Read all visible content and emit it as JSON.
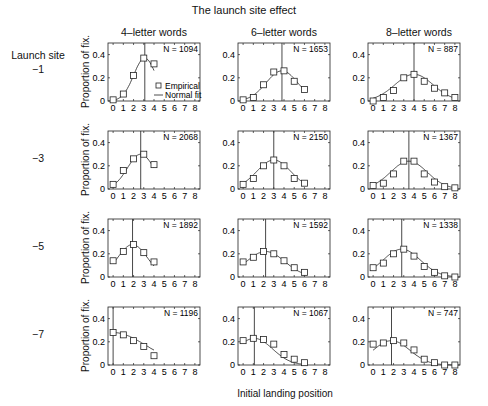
{
  "figure": {
    "title": "The launch site effect",
    "row_header": "Launch site",
    "column_titles": [
      "4–letter words",
      "6–letter words",
      "8–letter words"
    ],
    "row_labels": [
      "−1",
      "−3",
      "−5",
      "−7"
    ],
    "ylabel": "Proportion of fix.",
    "xlabel": "Initial landing position",
    "legend": {
      "empirical": "Empirical",
      "fit": "Normal fit"
    }
  },
  "chart_data": {
    "type": "line",
    "title": "The launch site effect",
    "xlabel": "Initial landing position",
    "ylabel": "Proportion of fix.",
    "xlim": [
      -0.5,
      8.5
    ],
    "ylim": [
      0,
      0.5
    ],
    "xticks": [
      0,
      1,
      2,
      3,
      4,
      5,
      6,
      7,
      8
    ],
    "yticks": [
      0,
      0.2,
      0.4
    ],
    "grid": false,
    "legend": [
      "Empirical",
      "Normal fit"
    ],
    "legend_position": "lower right (first panel only)",
    "panels": [
      {
        "row": "-1",
        "col": "4-letter words",
        "N": "N = 1094",
        "mean_line": 3.1,
        "x": [
          0,
          1,
          2,
          3,
          4
        ],
        "empirical": [
          0.01,
          0.06,
          0.22,
          0.37,
          0.32
        ]
      },
      {
        "row": "-1",
        "col": "6-letter words",
        "N": "N = 1653",
        "mean_line": 3.8,
        "x": [
          0,
          1,
          2,
          3,
          4,
          5,
          6
        ],
        "empirical": [
          0.01,
          0.03,
          0.14,
          0.25,
          0.26,
          0.17,
          0.1
        ]
      },
      {
        "row": "-1",
        "col": "8-letter words",
        "N": "N = 887",
        "mean_line": 4.0,
        "x": [
          0,
          1,
          2,
          3,
          4,
          5,
          6,
          7,
          8
        ],
        "empirical": [
          0.0,
          0.03,
          0.09,
          0.2,
          0.23,
          0.17,
          0.11,
          0.07,
          0.03
        ]
      },
      {
        "row": "-3",
        "col": "4-letter words",
        "N": "N = 2068",
        "mean_line": 2.7,
        "x": [
          0,
          1,
          2,
          3,
          4
        ],
        "empirical": [
          0.04,
          0.16,
          0.26,
          0.3,
          0.21
        ]
      },
      {
        "row": "-3",
        "col": "6-letter words",
        "N": "N = 2150",
        "mean_line": 3.0,
        "x": [
          0,
          1,
          2,
          3,
          4,
          5,
          6
        ],
        "empirical": [
          0.04,
          0.09,
          0.2,
          0.25,
          0.2,
          0.09,
          0.05
        ]
      },
      {
        "row": "-3",
        "col": "8-letter words",
        "N": "N = 1367",
        "mean_line": 3.5,
        "x": [
          0,
          1,
          2,
          3,
          4,
          5,
          6,
          7,
          8
        ],
        "empirical": [
          0.03,
          0.05,
          0.13,
          0.24,
          0.24,
          0.13,
          0.06,
          0.02,
          0.01
        ]
      },
      {
        "row": "-5",
        "col": "4-letter words",
        "N": "N = 1892",
        "mean_line": 1.9,
        "x": [
          0,
          1,
          2,
          3,
          4
        ],
        "empirical": [
          0.14,
          0.22,
          0.28,
          0.21,
          0.13
        ]
      },
      {
        "row": "-5",
        "col": "6-letter words",
        "N": "N = 1592",
        "mean_line": 2.2,
        "x": [
          0,
          1,
          2,
          3,
          4,
          5,
          6
        ],
        "empirical": [
          0.13,
          0.17,
          0.22,
          0.2,
          0.14,
          0.08,
          0.04
        ]
      },
      {
        "row": "-5",
        "col": "8-letter words",
        "N": "N = 1338",
        "mean_line": 2.8,
        "x": [
          0,
          1,
          2,
          3,
          4,
          5,
          6,
          7,
          8
        ],
        "empirical": [
          0.08,
          0.12,
          0.2,
          0.24,
          0.18,
          0.09,
          0.04,
          0.01,
          0.0
        ]
      },
      {
        "row": "-7",
        "col": "4-letter words",
        "N": "N = 1196",
        "mean_line": 0.0,
        "x": [
          0,
          1,
          2,
          3,
          4
        ],
        "empirical": [
          0.28,
          0.26,
          0.21,
          0.16,
          0.08
        ]
      },
      {
        "row": "-7",
        "col": "6-letter words",
        "N": "N = 1067",
        "mean_line": 1.1,
        "x": [
          0,
          1,
          2,
          3,
          4,
          5,
          6
        ],
        "empirical": [
          0.21,
          0.23,
          0.22,
          0.18,
          0.09,
          0.05,
          0.02
        ]
      },
      {
        "row": "-7",
        "col": "8-letter words",
        "N": "N = 747",
        "mean_line": 1.8,
        "x": [
          0,
          1,
          2,
          3,
          4,
          5,
          6,
          7,
          8
        ],
        "empirical": [
          0.18,
          0.19,
          0.21,
          0.19,
          0.13,
          0.05,
          0.02,
          0.0,
          0.0
        ]
      }
    ]
  }
}
